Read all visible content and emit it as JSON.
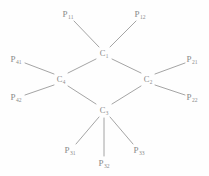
{
  "figure": {
    "kind": "chemical-structure-diagram",
    "background_color": "#fefefe",
    "bond_color": "#9a9a9a",
    "label_color": "#8a8a8a"
  },
  "ring_atoms": [
    {
      "id": "C1",
      "symbol": "C",
      "subscript": "1",
      "x": 104,
      "y": 53
    },
    {
      "id": "C2",
      "symbol": "C",
      "subscript": "2",
      "x": 148,
      "y": 79
    },
    {
      "id": "C3",
      "symbol": "C",
      "subscript": "3",
      "x": 104,
      "y": 110
    },
    {
      "id": "C4",
      "symbol": "C",
      "subscript": "4",
      "x": 61,
      "y": 79
    }
  ],
  "substituents": [
    {
      "id": "P11",
      "symbol": "P",
      "subscript": "11",
      "x": 68,
      "y": 14,
      "parent": "C1"
    },
    {
      "id": "P12",
      "symbol": "P",
      "subscript": "12",
      "x": 140,
      "y": 14,
      "parent": "C1"
    },
    {
      "id": "P21",
      "symbol": "P",
      "subscript": "21",
      "x": 192,
      "y": 59,
      "parent": "C2"
    },
    {
      "id": "P22",
      "symbol": "P",
      "subscript": "22",
      "x": 192,
      "y": 97,
      "parent": "C2"
    },
    {
      "id": "P31",
      "symbol": "P",
      "subscript": "31",
      "x": 70,
      "y": 150,
      "parent": "C3"
    },
    {
      "id": "P32",
      "symbol": "P",
      "subscript": "32",
      "x": 104,
      "y": 163,
      "parent": "C3"
    },
    {
      "id": "P33",
      "symbol": "P",
      "subscript": "33",
      "x": 139,
      "y": 150,
      "parent": "C3"
    },
    {
      "id": "P41",
      "symbol": "P",
      "subscript": "41",
      "x": 16,
      "y": 59,
      "parent": "C4"
    },
    {
      "id": "P42",
      "symbol": "P",
      "subscript": "42",
      "x": 16,
      "y": 97,
      "parent": "C4"
    }
  ],
  "ring_bonds": [
    {
      "id": "bond-c1-c2",
      "from": "C1",
      "to": "C2",
      "x1": 112,
      "y1": 59,
      "x2": 141,
      "y2": 73
    },
    {
      "id": "bond-c2-c3",
      "from": "C2",
      "to": "C3",
      "x1": 141,
      "y1": 86,
      "x2": 112,
      "y2": 104
    },
    {
      "id": "bond-c3-c4",
      "from": "C3",
      "to": "C4",
      "x1": 96,
      "y1": 104,
      "x2": 68,
      "y2": 86
    },
    {
      "id": "bond-c4-c1",
      "from": "C4",
      "to": "C1",
      "x1": 68,
      "y1": 73,
      "x2": 96,
      "y2": 59
    }
  ],
  "substituent_bonds": [
    {
      "id": "bond-c1-p11",
      "from": "C1",
      "to": "P11",
      "x1": 99,
      "y1": 47,
      "x2": 74,
      "y2": 21
    },
    {
      "id": "bond-c1-p12",
      "from": "C1",
      "to": "P12",
      "x1": 110,
      "y1": 47,
      "x2": 136,
      "y2": 21
    },
    {
      "id": "bond-c2-p21",
      "from": "C2",
      "to": "P21",
      "x1": 155,
      "y1": 74,
      "x2": 185,
      "y2": 63
    },
    {
      "id": "bond-c2-p22",
      "from": "C2",
      "to": "P22",
      "x1": 155,
      "y1": 85,
      "x2": 185,
      "y2": 95
    },
    {
      "id": "bond-c3-p31",
      "from": "C3",
      "to": "P31",
      "x1": 99,
      "y1": 117,
      "x2": 76,
      "y2": 144
    },
    {
      "id": "bond-c3-p32",
      "from": "C3",
      "to": "P32",
      "x1": 104,
      "y1": 118,
      "x2": 104,
      "y2": 156
    },
    {
      "id": "bond-c3-p33",
      "from": "C3",
      "to": "P33",
      "x1": 110,
      "y1": 117,
      "x2": 133,
      "y2": 144
    },
    {
      "id": "bond-c4-p41",
      "from": "C4",
      "to": "P41",
      "x1": 54,
      "y1": 74,
      "x2": 25,
      "y2": 63
    },
    {
      "id": "bond-c4-p42",
      "from": "C4",
      "to": "P42",
      "x1": 54,
      "y1": 85,
      "x2": 25,
      "y2": 95
    }
  ]
}
